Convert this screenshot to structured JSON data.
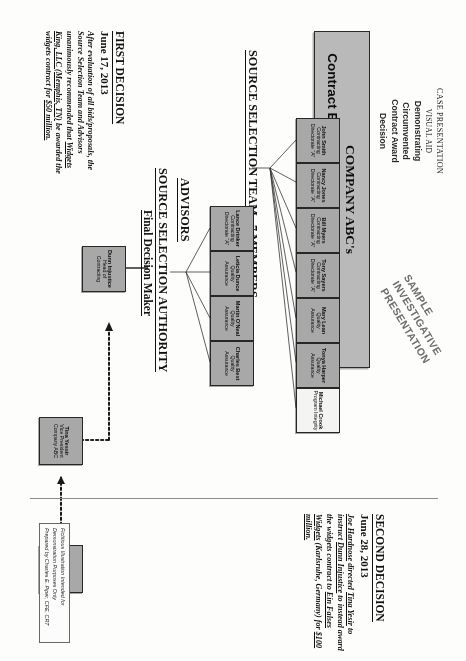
{
  "header": {
    "line1": "CASE PRESENTATION",
    "line2": "VISUAL AID",
    "line3": "Demonstrating",
    "line4": "Circumvented",
    "line5": "Contract Award",
    "line6": "Decision"
  },
  "title_box": {
    "line1": "COMPANY ABC's",
    "line2": "Contract Evaluation and Selection Committee"
  },
  "watermark": {
    "line1": "SAMPLE",
    "line2": "INVESTIGATIVE",
    "line3": "PRESENTATION"
  },
  "sections": {
    "team": "SOURCE SELECTION TEAM –7 MEMBERS",
    "advisors": "ADVISORS",
    "authority": "SOURCE SELECTION AUTHORITY",
    "authority_sub": "Final Decision Maker"
  },
  "team_members": [
    {
      "name": "John Smith",
      "line2": "Contracting",
      "line3": "Directorate “A”",
      "shade": "dark"
    },
    {
      "name": "Nancy Jones",
      "line2": "Contracting",
      "line3": "Directorate “A”",
      "shade": "dark"
    },
    {
      "name": "Bill Myers",
      "line2": "Contracting",
      "line3": "Directorate “A”",
      "shade": "dark"
    },
    {
      "name": "Tony Sayers",
      "line2": "Contracting",
      "line3": "Directorate “A”",
      "shade": "dark"
    },
    {
      "name": "Mary Lean",
      "line2": "Quality Assurance",
      "line3": "",
      "shade": "dark"
    },
    {
      "name": "Tonya Harper",
      "line2": "Quality Assurance",
      "line3": "",
      "shade": "dark"
    },
    {
      "name": "Michael Crook",
      "line2": "Program Integrity",
      "line3": "",
      "shade": "light"
    }
  ],
  "advisors": [
    {
      "name": "Lance Drinker",
      "line2": "Contracting",
      "line3": "Directorate “A”",
      "shade": "dark"
    },
    {
      "name": "Leticia Dunce",
      "line2": "Quality Assurance",
      "line3": "",
      "shade": "dark"
    },
    {
      "name": "Martin O’Neal",
      "line2": "Quality Assurance",
      "line3": "",
      "shade": "dark"
    },
    {
      "name": "Charles Best",
      "line2": "Quality Assurance",
      "line3": "",
      "shade": "dark"
    }
  ],
  "authority_node": {
    "name": "Dunn Injustice",
    "line2": "Head of",
    "line3": "Contracting",
    "shade": "dark"
  },
  "executives": [
    {
      "name": "Joe Hardnose",
      "line2": "President",
      "line3": "Company ABC",
      "shade": "dark"
    },
    {
      "name": "Tina Yessir",
      "line2": "Vice President",
      "line3": "Company ABC",
      "shade": "dark"
    }
  ],
  "first_decision": {
    "heading": "FIRST DECISION",
    "date": "June 17, 2013",
    "body_pre": "After evaluation of all bids/proposals, the Source Selection Team and Advisors unanimously recommended that ",
    "body_em1": "Widgets King, LLC (Memphis, TN)",
    "body_mid": " be awarded the widgets contract for ",
    "body_em2": "$50 million.",
    "body_post": ""
  },
  "second_decision": {
    "heading": "SECOND DECISION",
    "date": "June 28, 2013",
    "body_pre": "",
    "body_em1": "Joe Hardnose",
    "body_a": " directed ",
    "body_em2": "Tina Yesir",
    "body_b": " to instruct ",
    "body_em3": "Dunn Injustice",
    "body_c": " to instead award the widgets contract to ",
    "body_em4": "Ein Falses Widgets",
    "body_d": " (Karlsruhe, Germany) for ",
    "body_em5": "$100 million.",
    "body_post": ""
  },
  "credit": {
    "line1": "Fictitious Illustration Intended for Demonstration Purposes Only",
    "line2": "Prepared by Charles E. Piper, CFE, CRT"
  },
  "colors": {
    "node_fill": "#a8a8a8",
    "node_light": "#f2f2f0",
    "title_fill": "#b9b9b9",
    "ink": "#131313",
    "rule": "#8d8d8d",
    "watermark": "#6f6f6f"
  }
}
